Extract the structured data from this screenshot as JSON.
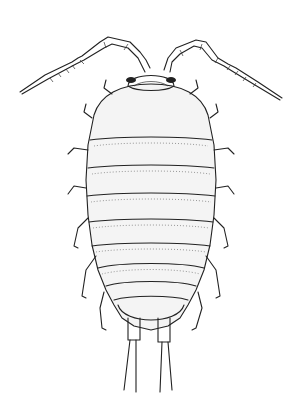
{
  "image": {
    "subject": "Dorsal view illustration of an isopod (woodlouse)",
    "style": "black ink stipple line drawing on white",
    "colors": {
      "background": "#ffffff",
      "ink": "#222222",
      "shading": "#f4f4f4"
    },
    "parts": {
      "antennae": 2,
      "head": 1,
      "thoracic_segments": 7,
      "abdominal_segments": 5,
      "legs_visible": 14,
      "uropods": 2
    }
  }
}
